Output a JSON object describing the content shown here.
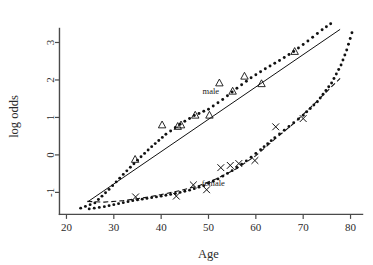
{
  "chart_data": {
    "type": "scatter",
    "title": "",
    "xlabel": "Age",
    "ylabel": "log odds",
    "xlim": [
      18,
      82
    ],
    "ylim": [
      -1.55,
      3.6
    ],
    "xticks": [
      20,
      30,
      40,
      50,
      60,
      70,
      80
    ],
    "yticks": [
      -1,
      0,
      1,
      2,
      3
    ],
    "xtick_labels": [
      "20",
      "30",
      "40",
      "50",
      "60",
      "70",
      "80"
    ],
    "ytick_labels": [
      "-1",
      "0",
      "1",
      "2",
      "3"
    ],
    "grid": false,
    "legend_position": "inline-annotations",
    "annotations": [
      {
        "text": "male",
        "x": 50.5,
        "y": 1.62
      },
      {
        "text": "female",
        "x": 51.0,
        "y": -0.82
      }
    ],
    "series": [
      {
        "name": "male",
        "marker": "triangle-up",
        "points": [
          {
            "x": 34.5,
            "y": -0.12
          },
          {
            "x": 40.2,
            "y": 0.8
          },
          {
            "x": 43.5,
            "y": 0.76
          },
          {
            "x": 44.2,
            "y": 0.8
          },
          {
            "x": 47.2,
            "y": 1.06
          },
          {
            "x": 50.2,
            "y": 1.06
          },
          {
            "x": 52.3,
            "y": 1.92
          },
          {
            "x": 55.1,
            "y": 1.7
          },
          {
            "x": 57.6,
            "y": 2.1
          },
          {
            "x": 61.2,
            "y": 1.9
          },
          {
            "x": 68.2,
            "y": 2.76
          }
        ]
      },
      {
        "name": "female",
        "marker": "x",
        "points": [
          {
            "x": 34.6,
            "y": -1.12
          },
          {
            "x": 43.2,
            "y": -1.1
          },
          {
            "x": 46.8,
            "y": -0.8
          },
          {
            "x": 49.6,
            "y": -0.93
          },
          {
            "x": 52.6,
            "y": -0.34
          },
          {
            "x": 54.6,
            "y": -0.28
          },
          {
            "x": 56.4,
            "y": -0.23
          },
          {
            "x": 59.8,
            "y": -0.15
          },
          {
            "x": 64.2,
            "y": 0.75
          },
          {
            "x": 70.0,
            "y": 0.97
          }
        ]
      }
    ],
    "fits": [
      {
        "name": "male-linear-fit",
        "style": "solid",
        "x_start": 24.5,
        "x_end": 77.8,
        "y_start": -1.25,
        "y_end": 3.35
      },
      {
        "name": "male-smooth-fit",
        "style": "dotted",
        "knots": [
          {
            "x": 23.0,
            "y": -1.42
          },
          {
            "x": 26.0,
            "y": -1.28
          },
          {
            "x": 29.0,
            "y": -0.92
          },
          {
            "x": 32.0,
            "y": -0.52
          },
          {
            "x": 35.0,
            "y": -0.14
          },
          {
            "x": 38.0,
            "y": 0.22
          },
          {
            "x": 41.0,
            "y": 0.55
          },
          {
            "x": 44.0,
            "y": 0.82
          },
          {
            "x": 47.0,
            "y": 1.05
          },
          {
            "x": 50.0,
            "y": 1.22
          },
          {
            "x": 53.0,
            "y": 1.48
          },
          {
            "x": 56.0,
            "y": 1.78
          },
          {
            "x": 59.0,
            "y": 2.06
          },
          {
            "x": 62.0,
            "y": 2.3
          },
          {
            "x": 65.0,
            "y": 2.52
          },
          {
            "x": 68.0,
            "y": 2.76
          },
          {
            "x": 71.0,
            "y": 3.04
          },
          {
            "x": 74.0,
            "y": 3.34
          },
          {
            "x": 75.8,
            "y": 3.5
          }
        ]
      },
      {
        "name": "female-dashed-fit",
        "style": "dashed",
        "knots": [
          {
            "x": 24.4,
            "y": -1.24
          },
          {
            "x": 28.0,
            "y": -1.26
          },
          {
            "x": 32.0,
            "y": -1.22
          },
          {
            "x": 36.0,
            "y": -1.15
          },
          {
            "x": 40.0,
            "y": -1.06
          },
          {
            "x": 44.0,
            "y": -0.95
          },
          {
            "x": 48.0,
            "y": -0.82
          },
          {
            "x": 52.0,
            "y": -0.62
          },
          {
            "x": 56.0,
            "y": -0.36
          },
          {
            "x": 60.0,
            "y": -0.02
          },
          {
            "x": 64.0,
            "y": 0.42
          },
          {
            "x": 68.0,
            "y": 0.84
          },
          {
            "x": 72.0,
            "y": 1.32
          },
          {
            "x": 76.0,
            "y": 1.82
          },
          {
            "x": 77.8,
            "y": 2.04
          }
        ]
      },
      {
        "name": "female-smooth-fit",
        "style": "dotted",
        "knots": [
          {
            "x": 24.8,
            "y": -1.44
          },
          {
            "x": 28.0,
            "y": -1.38
          },
          {
            "x": 31.0,
            "y": -1.3
          },
          {
            "x": 34.0,
            "y": -1.22
          },
          {
            "x": 37.0,
            "y": -1.16
          },
          {
            "x": 40.0,
            "y": -1.1
          },
          {
            "x": 43.0,
            "y": -1.03
          },
          {
            "x": 46.0,
            "y": -0.94
          },
          {
            "x": 49.0,
            "y": -0.82
          },
          {
            "x": 52.0,
            "y": -0.64
          },
          {
            "x": 55.0,
            "y": -0.42
          },
          {
            "x": 58.0,
            "y": -0.16
          },
          {
            "x": 61.0,
            "y": 0.14
          },
          {
            "x": 64.0,
            "y": 0.46
          },
          {
            "x": 67.0,
            "y": 0.76
          },
          {
            "x": 70.0,
            "y": 1.06
          },
          {
            "x": 73.0,
            "y": 1.42
          },
          {
            "x": 76.0,
            "y": 1.92
          },
          {
            "x": 78.0,
            "y": 2.4
          },
          {
            "x": 79.2,
            "y": 2.8
          },
          {
            "x": 80.3,
            "y": 3.26
          }
        ]
      }
    ]
  }
}
